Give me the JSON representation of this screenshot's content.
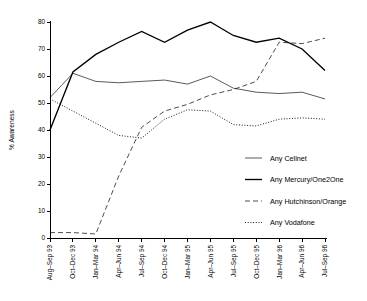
{
  "chart_data": {
    "type": "line",
    "title": "",
    "subtitle": "",
    "xlabel": "",
    "ylabel": "% Awareness",
    "ylim": [
      0,
      80
    ],
    "ytick_step": 10,
    "grid": false,
    "legend_position": "right-middle",
    "categories": [
      "Aug–Sep 93",
      "Oct–Dec 93",
      "Jan–Mar 94",
      "Apr–Jun 94",
      "Jul–Sep 94",
      "Oct–Dec 94",
      "Jan–Mar 95",
      "Apr–Jun 95",
      "Jul–Sep 95",
      "Oct–Dec 95",
      "Jan–Mar 96",
      "Apr–Jun 96",
      "Jul–Sep 96"
    ],
    "yticks": [
      0,
      10,
      20,
      30,
      40,
      50,
      60,
      70,
      80
    ],
    "series": [
      {
        "name": "Any Cellnet",
        "style": "solid-thin",
        "values": [
          52,
          61,
          58,
          57.5,
          58,
          58.5,
          57,
          60,
          55.5,
          54,
          53.5,
          54,
          51.5
        ]
      },
      {
        "name": "Any Mercury/One2One",
        "style": "solid-thick",
        "values": [
          40,
          61.5,
          68,
          72.5,
          76.5,
          72.5,
          77,
          80,
          75,
          72.5,
          74,
          70,
          62
        ]
      },
      {
        "name": "Any Hutchinson/Orange",
        "style": "dashed",
        "values": [
          2,
          2,
          1.5,
          23,
          41,
          47,
          49.5,
          53,
          55,
          58,
          72.5,
          72,
          74
        ]
      },
      {
        "name": "Any Vodafone",
        "style": "dotted",
        "values": [
          51.5,
          47,
          42.5,
          38,
          37,
          44,
          47.5,
          47,
          42,
          41.5,
          44,
          44.5,
          44
        ]
      }
    ]
  },
  "legend": {
    "items": [
      {
        "label": "Any Cellnet",
        "style": "solid-thin"
      },
      {
        "label": "Any Mercury/One2One",
        "style": "solid-thick"
      },
      {
        "label": "Any Hutchinson/Orange",
        "style": "dashed"
      },
      {
        "label": "Any Vodafone",
        "style": "dotted"
      }
    ]
  },
  "colors": {
    "axis": "#000000",
    "line": "#000000",
    "background": "#ffffff"
  }
}
